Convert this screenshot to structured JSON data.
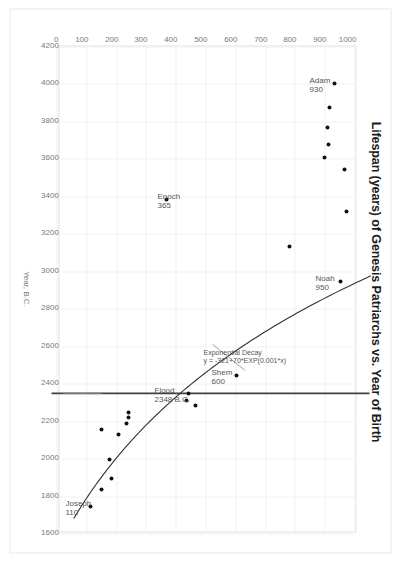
{
  "chart_data": {
    "type": "scatter",
    "title": "Lifespan (years) of Genesis Patriarchs vs. Year of Birth",
    "xlabel": "Year, B.C.",
    "ylabel": "",
    "xlim": [
      4200,
      1600
    ],
    "ylim": [
      0,
      1000
    ],
    "x_ticks": [
      4200,
      4000,
      3800,
      3600,
      3400,
      3200,
      3000,
      2800,
      2600,
      2400,
      2200,
      2000,
      1800,
      1600
    ],
    "y_ticks": [
      0,
      100,
      200,
      300,
      400,
      500,
      600,
      700,
      800,
      900,
      1000
    ],
    "grid": true,
    "legend": "none",
    "series": [
      {
        "name": "Genesis Patriarchs",
        "points": [
          {
            "label": "Adam",
            "x": 4004,
            "y": 930
          },
          {
            "label": "Seth",
            "x": 3874,
            "y": 912
          },
          {
            "label": "Enos",
            "x": 3769,
            "y": 905
          },
          {
            "label": "Cainan",
            "x": 3679,
            "y": 910
          },
          {
            "label": "Mahalaleel",
            "x": 3609,
            "y": 895
          },
          {
            "label": "Jared",
            "x": 3544,
            "y": 962
          },
          {
            "label": "Enoch",
            "x": 3382,
            "y": 365
          },
          {
            "label": "Methuselah",
            "x": 3317,
            "y": 969
          },
          {
            "label": "Lamech",
            "x": 3130,
            "y": 777
          },
          {
            "label": "Noah",
            "x": 2948,
            "y": 950
          },
          {
            "label": "Shem",
            "x": 2446,
            "y": 600
          },
          {
            "label": "Arphaxad",
            "x": 2346,
            "y": 438
          },
          {
            "label": "Salah",
            "x": 2311,
            "y": 433
          },
          {
            "label": "Eber",
            "x": 2281,
            "y": 464
          },
          {
            "label": "Peleg",
            "x": 2247,
            "y": 239
          },
          {
            "label": "Reu",
            "x": 2217,
            "y": 239
          },
          {
            "label": "Serug",
            "x": 2185,
            "y": 230
          },
          {
            "label": "Nahor",
            "x": 2155,
            "y": 148
          },
          {
            "label": "Terah",
            "x": 2126,
            "y": 205
          },
          {
            "label": "Abraham",
            "x": 1996,
            "y": 175
          },
          {
            "label": "Isaac",
            "x": 1896,
            "y": 180
          },
          {
            "label": "Jacob",
            "x": 1836,
            "y": 147
          },
          {
            "label": "Joseph",
            "x": 1745,
            "y": 110
          }
        ]
      }
    ],
    "fit_curve": {
      "name": "Exponential Decay",
      "equation": "y = -321+70*EXP(0.001*x)",
      "x_start": 4200,
      "x_end": 1680
    },
    "reference_line": {
      "name": "Flood",
      "orientation": "vertical-in-data",
      "x": 2348,
      "label": "Flood",
      "sublabel": "2348 B.C."
    }
  },
  "annotations": [
    {
      "name": "adam-label",
      "line1": "Adam",
      "line2": "930",
      "x": 4004,
      "y": 930
    },
    {
      "name": "noah-label",
      "line1": "Noah",
      "line2": "950",
      "x": 2948,
      "y": 950
    },
    {
      "name": "enoch-label",
      "line1": "Enoch",
      "line2": "365",
      "x": 3382,
      "y": 365
    },
    {
      "name": "shem-label",
      "line1": "Shem",
      "line2": "600",
      "x": 2446,
      "y": 600
    },
    {
      "name": "joseph-label",
      "line1": "Joseph",
      "line2": "110",
      "x": 1745,
      "y": 110
    },
    {
      "name": "flood-label",
      "line1": "Flood",
      "line2": "2348 B.C.",
      "x": 2348,
      "y": 0
    },
    {
      "name": "fit-label",
      "line1": "Exponential Decay",
      "line2": "y = -321+70*EXP(0.001*x)",
      "x": 2560,
      "y": 520
    }
  ],
  "colors": {
    "marker": "#111111",
    "curve": "#333333",
    "reference_line": "#404040",
    "grid": "#f1f1f1",
    "axis_text": "#7a7a7a",
    "title_text": "#1a1a1a",
    "annotation_text": "#555555",
    "plot_border": "#e0e0e0",
    "frame_border": "#e8e8e8",
    "background": "#ffffff"
  }
}
